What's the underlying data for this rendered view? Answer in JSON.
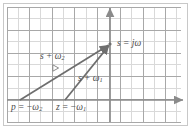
{
  "figure": {
    "width": 191,
    "height": 135,
    "background": "#ffffff",
    "border_color": "#c8c8c8"
  },
  "grid": {
    "cell_px": 11.2,
    "x_start": 7,
    "x_end": 181,
    "y_start": 7,
    "y_end": 122,
    "minor_color": "#d9d9d9",
    "major_color": "#a8a8a8",
    "major_every": 2,
    "visible": true
  },
  "axes": {
    "color": "#8a8a8a",
    "origin_x": 110,
    "origin_y": 100,
    "real_axis": {
      "name": "real-axis",
      "x_from": 7,
      "x_to": 185,
      "y": 100,
      "arrow": "right"
    },
    "imag_axis": {
      "name": "imaginary-axis",
      "y_from": 6,
      "y_to": 122,
      "x": 110,
      "arrow": "up"
    }
  },
  "points": {
    "s": {
      "label": "s",
      "op": " = ",
      "value": "jω",
      "x": 110,
      "y": 44
    },
    "p": {
      "label": "p",
      "op": " = ",
      "value": "−ω",
      "sub": "2",
      "x": 20,
      "y": 100
    },
    "z": {
      "label": "z",
      "op": " = ",
      "value": "−ω",
      "sub": "1",
      "x": 65,
      "y": 100
    }
  },
  "vectors": [
    {
      "name": "vector-s-plus-omega2",
      "label": "s",
      "op": " + ",
      "value": "ω",
      "sub": "2",
      "from_x": 20,
      "from_y": 100,
      "to_x": 110,
      "to_y": 44,
      "color": "#6e6e6e"
    },
    {
      "name": "vector-s-plus-omega1",
      "label": "s",
      "op": " + ",
      "value": "ω",
      "sub": "1",
      "from_x": 65,
      "from_y": 100,
      "to_x": 110,
      "to_y": 44,
      "color": "#6e6e6e"
    }
  ],
  "angle_marker": {
    "name": "angle-marker",
    "x": 55,
    "y": 68,
    "color": "#8a8a8a"
  },
  "labels": {
    "s_jw": {
      "head": "s",
      "op": " = ",
      "tail": "jω"
    },
    "s_w2": {
      "head": "s",
      "op": " + ",
      "tail": "ω",
      "sub": "2"
    },
    "s_w1": {
      "head": "s",
      "op": " + ",
      "tail": "ω",
      "sub": "1"
    },
    "p_w2": {
      "head": "p",
      "op": " = −",
      "tail": "ω",
      "sub": "2"
    },
    "z_w1": {
      "head": "z",
      "op": " = −",
      "tail": "ω",
      "sub": "1"
    }
  },
  "colors": {
    "vector": "#6e6e6e",
    "axis": "#8a8a8a",
    "grid_minor": "#d9d9d9",
    "grid_major": "#a8a8a8",
    "text": "#4a4a4a"
  }
}
